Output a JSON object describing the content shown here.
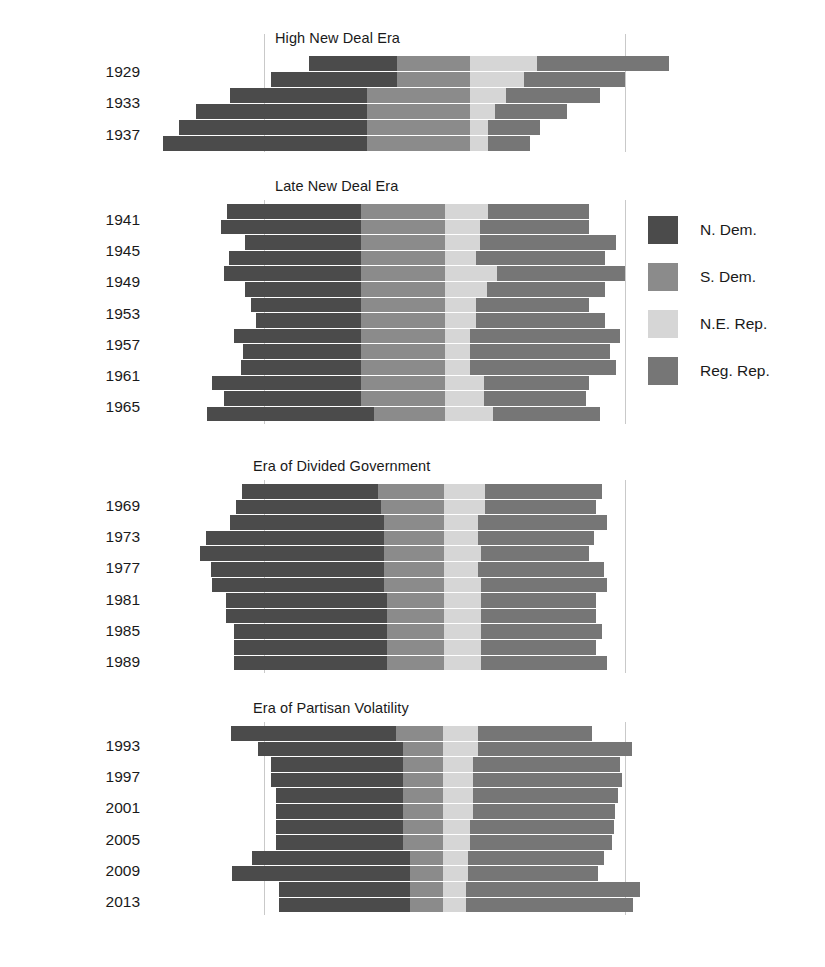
{
  "figure": {
    "type": "stacked-horizontal-bar",
    "background": "#ffffff",
    "x_axis": {
      "centered": true,
      "gridlines_at_pixels": [
        264,
        625
      ],
      "range_seats": [
        0,
        435
      ],
      "ticks_visible": false
    }
  },
  "legend": {
    "position": "right",
    "items": [
      {
        "label": "N. Dem.",
        "key": "n_dem",
        "color": "#4b4b4b"
      },
      {
        "label": "S. Dem.",
        "key": "s_dem",
        "color": "#8b8b8b"
      },
      {
        "label": "N.E. Rep.",
        "key": "ne_rep",
        "color": "#d6d6d6"
      },
      {
        "label": "Reg. Rep.",
        "key": "reg_rep",
        "color": "#767676"
      }
    ]
  },
  "panels": [
    {
      "title": "High New Deal Era",
      "year_labels": [
        "1929",
        "1933",
        "1937"
      ],
      "rows": [
        {
          "left": 309,
          "b1": 397,
          "b2": 470,
          "b3": 537,
          "right": 669
        },
        {
          "left": 271,
          "b1": 397,
          "b2": 470,
          "b3": 524,
          "right": 625
        },
        {
          "left": 230,
          "b1": 367,
          "b2": 470,
          "b3": 506,
          "right": 600
        },
        {
          "left": 196,
          "b1": 367,
          "b2": 470,
          "b3": 495,
          "right": 567
        },
        {
          "left": 179,
          "b1": 367,
          "b2": 470,
          "b3": 488,
          "right": 540
        },
        {
          "left": 163,
          "b1": 367,
          "b2": 470,
          "b3": 488,
          "right": 530
        }
      ]
    },
    {
      "title": "Late New Deal Era",
      "year_labels": [
        "1941",
        "1945",
        "1949",
        "1953",
        "1957",
        "1961",
        "1965"
      ],
      "rows": [
        {
          "left": 227,
          "b1": 361,
          "b2": 445,
          "b3": 488,
          "right": 589
        },
        {
          "left": 221,
          "b1": 361,
          "b2": 445,
          "b3": 480,
          "right": 589
        },
        {
          "left": 245,
          "b1": 361,
          "b2": 445,
          "b3": 480,
          "right": 616
        },
        {
          "left": 229,
          "b1": 361,
          "b2": 445,
          "b3": 476,
          "right": 605
        },
        {
          "left": 224,
          "b1": 361,
          "b2": 445,
          "b3": 497,
          "right": 625
        },
        {
          "left": 245,
          "b1": 361,
          "b2": 445,
          "b3": 487,
          "right": 605
        },
        {
          "left": 251,
          "b1": 361,
          "b2": 445,
          "b3": 476,
          "right": 589
        },
        {
          "left": 256,
          "b1": 361,
          "b2": 445,
          "b3": 476,
          "right": 605
        },
        {
          "left": 234,
          "b1": 361,
          "b2": 445,
          "b3": 470,
          "right": 620
        },
        {
          "left": 243,
          "b1": 361,
          "b2": 445,
          "b3": 470,
          "right": 610
        },
        {
          "left": 241,
          "b1": 361,
          "b2": 445,
          "b3": 470,
          "right": 616
        },
        {
          "left": 212,
          "b1": 361,
          "b2": 445,
          "b3": 484,
          "right": 589
        },
        {
          "left": 224,
          "b1": 361,
          "b2": 445,
          "b3": 484,
          "right": 586
        },
        {
          "left": 207,
          "b1": 374,
          "b2": 445,
          "b3": 493,
          "right": 600
        }
      ]
    },
    {
      "title": "Era of Divided Government",
      "year_labels": [
        "1969",
        "1973",
        "1977",
        "1981",
        "1985",
        "1989"
      ],
      "rows": [
        {
          "left": 242,
          "b1": 378,
          "b2": 444,
          "b3": 485,
          "right": 602
        },
        {
          "left": 236,
          "b1": 381,
          "b2": 444,
          "b3": 485,
          "right": 596
        },
        {
          "left": 230,
          "b1": 384,
          "b2": 444,
          "b3": 478,
          "right": 607
        },
        {
          "left": 206,
          "b1": 384,
          "b2": 444,
          "b3": 478,
          "right": 594
        },
        {
          "left": 200,
          "b1": 384,
          "b2": 444,
          "b3": 481,
          "right": 589
        },
        {
          "left": 211,
          "b1": 384,
          "b2": 444,
          "b3": 478,
          "right": 604
        },
        {
          "left": 212,
          "b1": 384,
          "b2": 444,
          "b3": 481,
          "right": 607
        },
        {
          "left": 226,
          "b1": 387,
          "b2": 444,
          "b3": 481,
          "right": 596
        },
        {
          "left": 226,
          "b1": 387,
          "b2": 444,
          "b3": 481,
          "right": 596
        },
        {
          "left": 234,
          "b1": 387,
          "b2": 444,
          "b3": 481,
          "right": 602
        },
        {
          "left": 234,
          "b1": 387,
          "b2": 444,
          "b3": 481,
          "right": 596
        },
        {
          "left": 234,
          "b1": 387,
          "b2": 444,
          "b3": 481,
          "right": 607
        }
      ]
    },
    {
      "title": "Era of Partisan Volatility",
      "year_labels": [
        "1993",
        "1997",
        "2001",
        "2005",
        "2009",
        "2013"
      ],
      "rows": [
        {
          "left": 231,
          "b1": 396,
          "b2": 443,
          "b3": 478,
          "right": 592
        },
        {
          "left": 258,
          "b1": 403,
          "b2": 443,
          "b3": 478,
          "right": 632
        },
        {
          "left": 271,
          "b1": 403,
          "b2": 443,
          "b3": 473,
          "right": 620
        },
        {
          "left": 271,
          "b1": 403,
          "b2": 443,
          "b3": 473,
          "right": 622
        },
        {
          "left": 276,
          "b1": 403,
          "b2": 443,
          "b3": 473,
          "right": 618
        },
        {
          "left": 276,
          "b1": 403,
          "b2": 443,
          "b3": 473,
          "right": 615
        },
        {
          "left": 276,
          "b1": 403,
          "b2": 443,
          "b3": 470,
          "right": 614
        },
        {
          "left": 276,
          "b1": 403,
          "b2": 443,
          "b3": 470,
          "right": 612
        },
        {
          "left": 252,
          "b1": 410,
          "b2": 443,
          "b3": 468,
          "right": 604
        },
        {
          "left": 232,
          "b1": 410,
          "b2": 443,
          "b3": 468,
          "right": 598
        },
        {
          "left": 279,
          "b1": 410,
          "b2": 443,
          "b3": 466,
          "right": 640
        },
        {
          "left": 279,
          "b1": 410,
          "b2": 443,
          "b3": 466,
          "right": 633
        }
      ]
    }
  ],
  "chart_data": {
    "type": "bar",
    "title": "",
    "subtitle": "",
    "xlabel": "",
    "ylabel": "",
    "orientation": "horizontal",
    "stacked": true,
    "centered_on_chamber_midpoint": true,
    "legend_position": "right",
    "grid": true,
    "series": [
      {
        "name": "N. Dem.",
        "color": "#4b4b4b"
      },
      {
        "name": "S. Dem.",
        "color": "#8b8b8b"
      },
      {
        "name": "N.E. Rep.",
        "color": "#d6d6d6"
      },
      {
        "name": "Reg. Rep.",
        "color": "#767676"
      }
    ],
    "panels": [
      {
        "name": "High New Deal Era",
        "categories": [
          "1929",
          "1931",
          "1933",
          "1935",
          "1937",
          "1939"
        ],
        "tick_labels": [
          "1929",
          "1933",
          "1937"
        ],
        "values": {
          "N. Dem.": [
            73,
            105,
            114,
            142,
            156,
            170
          ],
          "S. Dem.": [
            61,
            105,
            86,
            86,
            86,
            86
          ],
          "N.E. Rep.": [
            56,
            45,
            86,
            86,
            86,
            86
          ],
          "Reg. Rep.": [
            110,
            84,
            78,
            60,
            43,
            35
          ]
        }
      },
      {
        "name": "Late New Deal Era",
        "categories": [
          "1941",
          "1943",
          "1945",
          "1947",
          "1949",
          "1951",
          "1953",
          "1955",
          "1957",
          "1959",
          "1961",
          "1963",
          "1965",
          "1967"
        ],
        "tick_labels": [
          "1941",
          "1945",
          "1949",
          "1953",
          "1957",
          "1961",
          "1965"
        ],
        "values": {
          "N. Dem.": [
            112,
            117,
            117,
            97,
            130,
            110,
            111,
            103,
            118,
            113,
            115,
            124,
            140,
            138
          ],
          "S. Dem.": [
            70,
            70,
            70,
            70,
            70,
            70,
            70,
            70,
            70,
            70,
            70,
            70,
            70,
            59
          ],
          "N.E. Rep.": [
            36,
            29,
            29,
            26,
            35,
            26,
            26,
            26,
            21,
            21,
            21,
            32,
            32,
            40
          ],
          "Reg. Rep.": [
            84,
            91,
            91,
            120,
            113,
            108,
            94,
            107,
            107,
            117,
            123,
            88,
            85,
            89
          ]
        }
      },
      {
        "name": "Era of Divided Government",
        "categories": [
          "1969",
          "1971",
          "1973",
          "1975",
          "1977",
          "1979",
          "1981",
          "1983",
          "1985",
          "1987",
          "1989",
          "1991"
        ],
        "tick_labels": [
          "1969",
          "1973",
          "1977",
          "1981",
          "1985",
          "1989"
        ],
        "values": {
          "N. Dem.": [
            113,
            121,
            128,
            148,
            148,
            140,
            143,
            134,
            134,
            128,
            128,
            128
          ],
          "S. Dem.": [
            55,
            53,
            50,
            50,
            50,
            50,
            50,
            48,
            48,
            48,
            48,
            48
          ],
          "N.E. Rep.": [
            34,
            34,
            28,
            28,
            31,
            28,
            31,
            28,
            28,
            28,
            28,
            28
          ],
          "Reg. Rep.": [
            98,
            93,
            108,
            97,
            90,
            105,
            105,
            96,
            96,
            101,
            96,
            105
          ]
        }
      },
      {
        "name": "Era of Partisan Volatility",
        "categories": [
          "1993",
          "1995",
          "1997",
          "1999",
          "2001",
          "2003",
          "2005",
          "2007",
          "2009",
          "2011",
          "2013",
          "2015"
        ],
        "tick_labels": [
          "1993",
          "1997",
          "2001",
          "2005",
          "2009",
          "2013"
        ],
        "values": {
          "N. Dem.": [
            138,
            121,
            113,
            113,
            106,
            106,
            106,
            106,
            132,
            156,
            105,
            105
          ],
          "S. Dem.": [
            39,
            33,
            33,
            33,
            33,
            33,
            33,
            33,
            28,
            28,
            28,
            28
          ],
          "N.E. Rep.": [
            29,
            29,
            25,
            25,
            25,
            25,
            23,
            23,
            21,
            21,
            19,
            19
          ],
          "Reg. Rep.": [
            95,
            129,
            123,
            124,
            121,
            119,
            119,
            118,
            113,
            109,
            145,
            140
          ]
        }
      }
    ]
  }
}
